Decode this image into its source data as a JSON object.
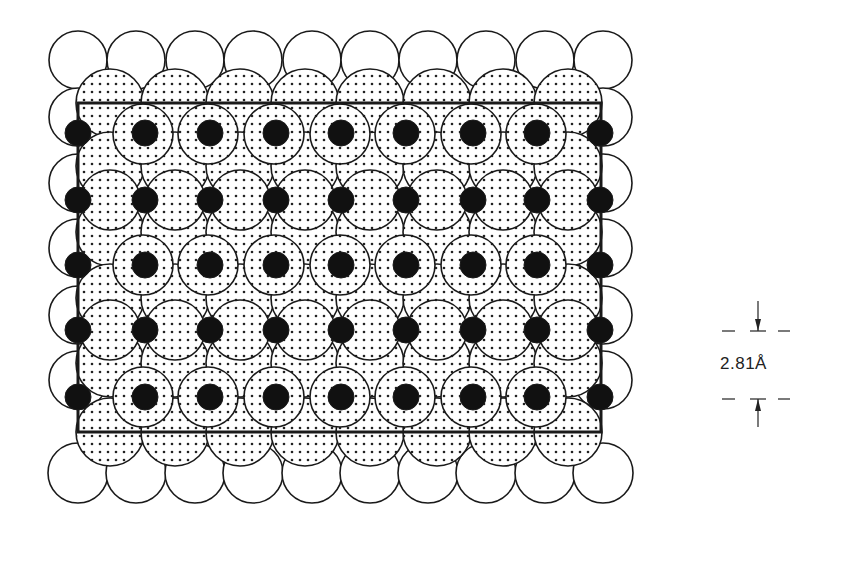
{
  "figure": {
    "colors": {
      "line": "#1a1a1a",
      "fill_black": "#111111",
      "background": "#ffffff",
      "dot_pattern": "#222222"
    },
    "unit_cell": {
      "x": 78,
      "y": 103,
      "width": 523,
      "height": 329
    },
    "open_circles_top": {
      "y": 60,
      "r": 29,
      "x": [
        78,
        136,
        195,
        253,
        312,
        370,
        428,
        486,
        545,
        603
      ]
    },
    "open_circles_bottom": {
      "y": 473,
      "r": 30,
      "x": [
        78,
        136,
        195,
        253,
        312,
        370,
        428,
        486,
        545,
        603
      ]
    },
    "open_circles_left": {
      "x": 78,
      "r": 29,
      "y": [
        117,
        183,
        248,
        315,
        380
      ]
    },
    "open_circles_right": {
      "x": 603,
      "r": 29,
      "y": [
        117,
        183,
        248,
        315,
        380
      ]
    },
    "dotted_rows": [
      {
        "y": 103,
        "r": 34,
        "x": [
          110,
          175,
          240,
          305,
          370,
          437,
          503,
          568
        ]
      },
      {
        "y": 166,
        "r": 34,
        "x": [
          110,
          175,
          240,
          305,
          370,
          437,
          503,
          568
        ]
      },
      {
        "y": 232,
        "r": 34,
        "x": [
          110,
          175,
          240,
          305,
          370,
          437,
          503,
          568
        ]
      },
      {
        "y": 298,
        "r": 34,
        "x": [
          110,
          175,
          240,
          305,
          370,
          437,
          503,
          568
        ]
      },
      {
        "y": 363,
        "r": 34,
        "x": [
          110,
          175,
          240,
          305,
          370,
          437,
          503,
          568
        ]
      },
      {
        "y": 432,
        "r": 34,
        "x": [
          110,
          175,
          240,
          305,
          370,
          437,
          503,
          568
        ]
      }
    ],
    "dotted_offset_rows": [
      {
        "y": 134,
        "r": 30,
        "x": [
          143,
          208,
          274,
          340,
          405,
          471,
          536
        ]
      },
      {
        "y": 200,
        "r": 30,
        "x": [
          110,
          175,
          240,
          305,
          370,
          437,
          503,
          568
        ]
      },
      {
        "y": 265,
        "r": 30,
        "x": [
          143,
          208,
          274,
          340,
          405,
          471,
          536
        ]
      },
      {
        "y": 330,
        "r": 30,
        "x": [
          110,
          175,
          240,
          305,
          370,
          437,
          503,
          568
        ]
      },
      {
        "y": 397,
        "r": 30,
        "x": [
          143,
          208,
          274,
          340,
          405,
          471,
          536
        ]
      }
    ],
    "black_dots": {
      "r": 13,
      "rows_y": [
        133,
        200,
        265,
        330,
        397
      ],
      "x": [
        78,
        145,
        210,
        276,
        341,
        406,
        473,
        537,
        600
      ]
    },
    "scale_bar": {
      "label": "2.81Å",
      "top_line_y": 331,
      "bottom_line_y": 399,
      "x_start": 722,
      "x_end": 790,
      "arrow_x": 758
    }
  }
}
